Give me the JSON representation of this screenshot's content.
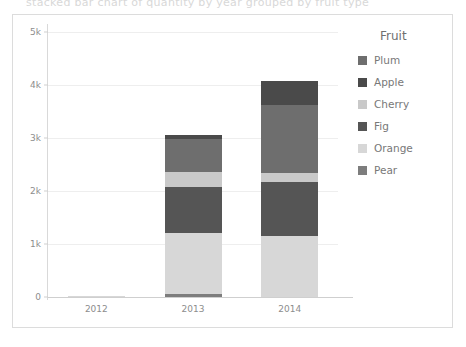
{
  "ghost_text": "stacked bar chart of quantity by year grouped by fruit type",
  "legend": {
    "title": "Fruit",
    "items": [
      {
        "label": "Plum",
        "color": "#6e6e6e"
      },
      {
        "label": "Apple",
        "color": "#4a4a4a"
      },
      {
        "label": "Cherry",
        "color": "#c9c9c9"
      },
      {
        "label": "Fig",
        "color": "#555555"
      },
      {
        "label": "Orange",
        "color": "#d7d7d7"
      },
      {
        "label": "Pear",
        "color": "#7d7d7d"
      }
    ]
  },
  "axes": {
    "y_ticks": [
      "0",
      "1k",
      "2k",
      "3k",
      "4k",
      "5k"
    ],
    "y_tick_values": [
      0,
      1000,
      2000,
      3000,
      4000,
      5000
    ],
    "x_ticks": [
      "2012",
      "2013",
      "2014"
    ]
  },
  "chart_data": {
    "type": "bar",
    "stacked": true,
    "title": "",
    "xlabel": "",
    "ylabel": "",
    "ylim": [
      0,
      5000
    ],
    "grid": true,
    "legend_position": "right",
    "legend_title": "Fruit",
    "categories": [
      "2012",
      "2013",
      "2014"
    ],
    "stack_order_bottom_to_top": [
      "Pear",
      "Orange",
      "Fig",
      "Cherry",
      "Apple",
      "Plum"
    ],
    "series": [
      {
        "name": "Pear",
        "color": "#7d7d7d",
        "values": [
          0,
          60,
          0
        ]
      },
      {
        "name": "Orange",
        "color": "#d7d7d7",
        "values": [
          10,
          1140,
          1150
        ]
      },
      {
        "name": "Fig",
        "color": "#555555",
        "values": [
          0,
          880,
          1020
        ]
      },
      {
        "name": "Cherry",
        "color": "#c9c9c9",
        "values": [
          0,
          280,
          170
        ]
      },
      {
        "name": "Apple",
        "color": "#6e6e6e",
        "values": [
          0,
          620,
          1280
        ]
      },
      {
        "name": "Plum",
        "color": "#4a4a4a",
        "values": [
          0,
          80,
          450
        ]
      }
    ],
    "totals": [
      10,
      3060,
      4070
    ]
  }
}
